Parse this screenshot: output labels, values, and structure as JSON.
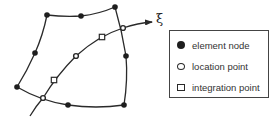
{
  "figure": {
    "axis_label": "ξ",
    "element_nodes": [
      {
        "x": 47,
        "y": 15
      },
      {
        "x": 81,
        "y": 16
      },
      {
        "x": 115,
        "y": 7
      },
      {
        "x": 35,
        "y": 53
      },
      {
        "x": 126,
        "y": 56
      },
      {
        "x": 17,
        "y": 87
      },
      {
        "x": 68,
        "y": 105
      },
      {
        "x": 124,
        "y": 105
      }
    ],
    "location_points": [
      {
        "x": 43,
        "y": 98
      },
      {
        "x": 76,
        "y": 56
      },
      {
        "x": 123,
        "y": 28
      }
    ],
    "integration_points": [
      {
        "x": 54,
        "y": 80
      },
      {
        "x": 102,
        "y": 37
      }
    ]
  },
  "legend": {
    "items": [
      {
        "symbol": "filled-circle",
        "label": "element node"
      },
      {
        "symbol": "open-circle",
        "label": "location point"
      },
      {
        "symbol": "open-square",
        "label": "integration point"
      }
    ]
  },
  "colors": {
    "stroke": "#2a2a2a",
    "node_fill": "#1e1e1e",
    "background": "#ffffff"
  }
}
